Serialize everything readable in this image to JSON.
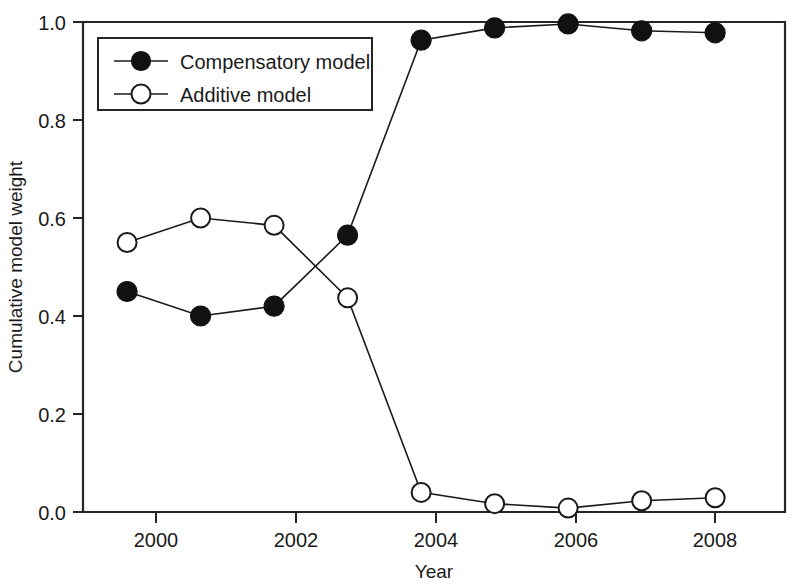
{
  "chart_data": {
    "type": "line",
    "title": "",
    "xlabel": "Year",
    "ylabel": "Cumulative model weight",
    "categories": [
      2000,
      2001,
      2002,
      2003,
      2004,
      2005,
      2006,
      2007,
      2008
    ],
    "x": [
      2000,
      2001,
      2002,
      2003,
      2004,
      2005,
      2006,
      2007,
      2008
    ],
    "xlim": [
      1999.4,
      2008.95
    ],
    "ylim": [
      0.0,
      1.0
    ],
    "xticks": [
      "2000",
      "2002",
      "2004",
      "2006",
      "2008"
    ],
    "xtick_values": [
      2000,
      2002,
      2004,
      2006,
      2008
    ],
    "yticks": [
      "0.0",
      "0.2",
      "0.4",
      "0.6",
      "0.8",
      "1.0"
    ],
    "ytick_values": [
      0.0,
      0.2,
      0.4,
      0.6,
      0.8,
      1.0
    ],
    "grid": false,
    "legend_position": "upper left inside",
    "series": [
      {
        "name": "Compensatory model",
        "marker": "filled-circle",
        "color": "#111111",
        "values": [
          0.45,
          0.4,
          0.42,
          0.565,
          0.963,
          0.988,
          0.996,
          0.982,
          0.978
        ]
      },
      {
        "name": "Additive model",
        "marker": "open-circle",
        "color": "#ffffff",
        "values": [
          0.55,
          0.6,
          0.585,
          0.437,
          0.04,
          0.017,
          0.008,
          0.023,
          0.029
        ]
      }
    ],
    "annotations": []
  },
  "legend": {
    "entries": [
      {
        "label": "Compensatory model",
        "marker": "filled-circle"
      },
      {
        "label": "Additive model",
        "marker": "open-circle"
      }
    ]
  },
  "axes": {
    "x_title": "Year",
    "y_title": "Cumulative model weight"
  }
}
